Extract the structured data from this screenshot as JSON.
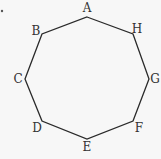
{
  "diagram": {
    "type": "octagon",
    "stroke_color": "#2a2a2a",
    "vertices": [
      {
        "label": "A",
        "x": 87,
        "y": 17,
        "lx": 87,
        "ly": 12
      },
      {
        "label": "H",
        "x": 133,
        "y": 34,
        "lx": 137,
        "ly": 33
      },
      {
        "label": "G",
        "x": 149,
        "y": 79,
        "lx": 155,
        "ly": 83
      },
      {
        "label": "F",
        "x": 133,
        "y": 121,
        "lx": 139,
        "ly": 132
      },
      {
        "label": "E",
        "x": 87,
        "y": 139,
        "lx": 87,
        "ly": 151
      },
      {
        "label": "D",
        "x": 42,
        "y": 121,
        "lx": 37,
        "ly": 132
      },
      {
        "label": "C",
        "x": 25,
        "y": 79,
        "lx": 18,
        "ly": 83
      },
      {
        "label": "B",
        "x": 42,
        "y": 34,
        "lx": 36,
        "ly": 35
      }
    ],
    "stray_mark": {
      "x": 2,
      "y": 11
    }
  }
}
